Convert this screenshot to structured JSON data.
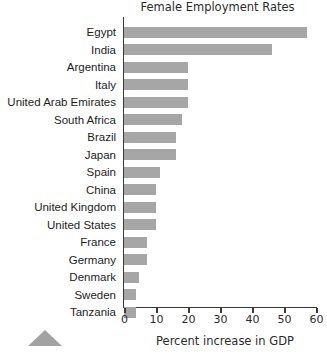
{
  "chart_data": {
    "type": "bar",
    "orientation": "horizontal",
    "title": "Female Employment Rates",
    "xlabel": "Percent increase in GDP",
    "ylabel": "",
    "xlim": [
      0,
      62
    ],
    "xticks": [
      0,
      10,
      20,
      30,
      40,
      50,
      60
    ],
    "xtick_labels": [
      "0",
      "10",
      "20",
      "30",
      "40",
      "50",
      "60"
    ],
    "grid": false,
    "legend": null,
    "bar_color": "#a6a6a6",
    "axis_color": "#3b3b3b",
    "categories": [
      "Egypt",
      "India",
      "Argentina",
      "Italy",
      "United Arab Emirates",
      "South Africa",
      "Brazil",
      "Japan",
      "Spain",
      "China",
      "United Kingdom",
      "United States",
      "France",
      "Germany",
      "Denmark",
      "Sweden",
      "Tanzania"
    ],
    "values": [
      57,
      46,
      20,
      20,
      20,
      18,
      16,
      16,
      11,
      10,
      10,
      10,
      7,
      7,
      4.5,
      3.5,
      3.5
    ]
  },
  "marker": {
    "name": "triangle-marker"
  }
}
